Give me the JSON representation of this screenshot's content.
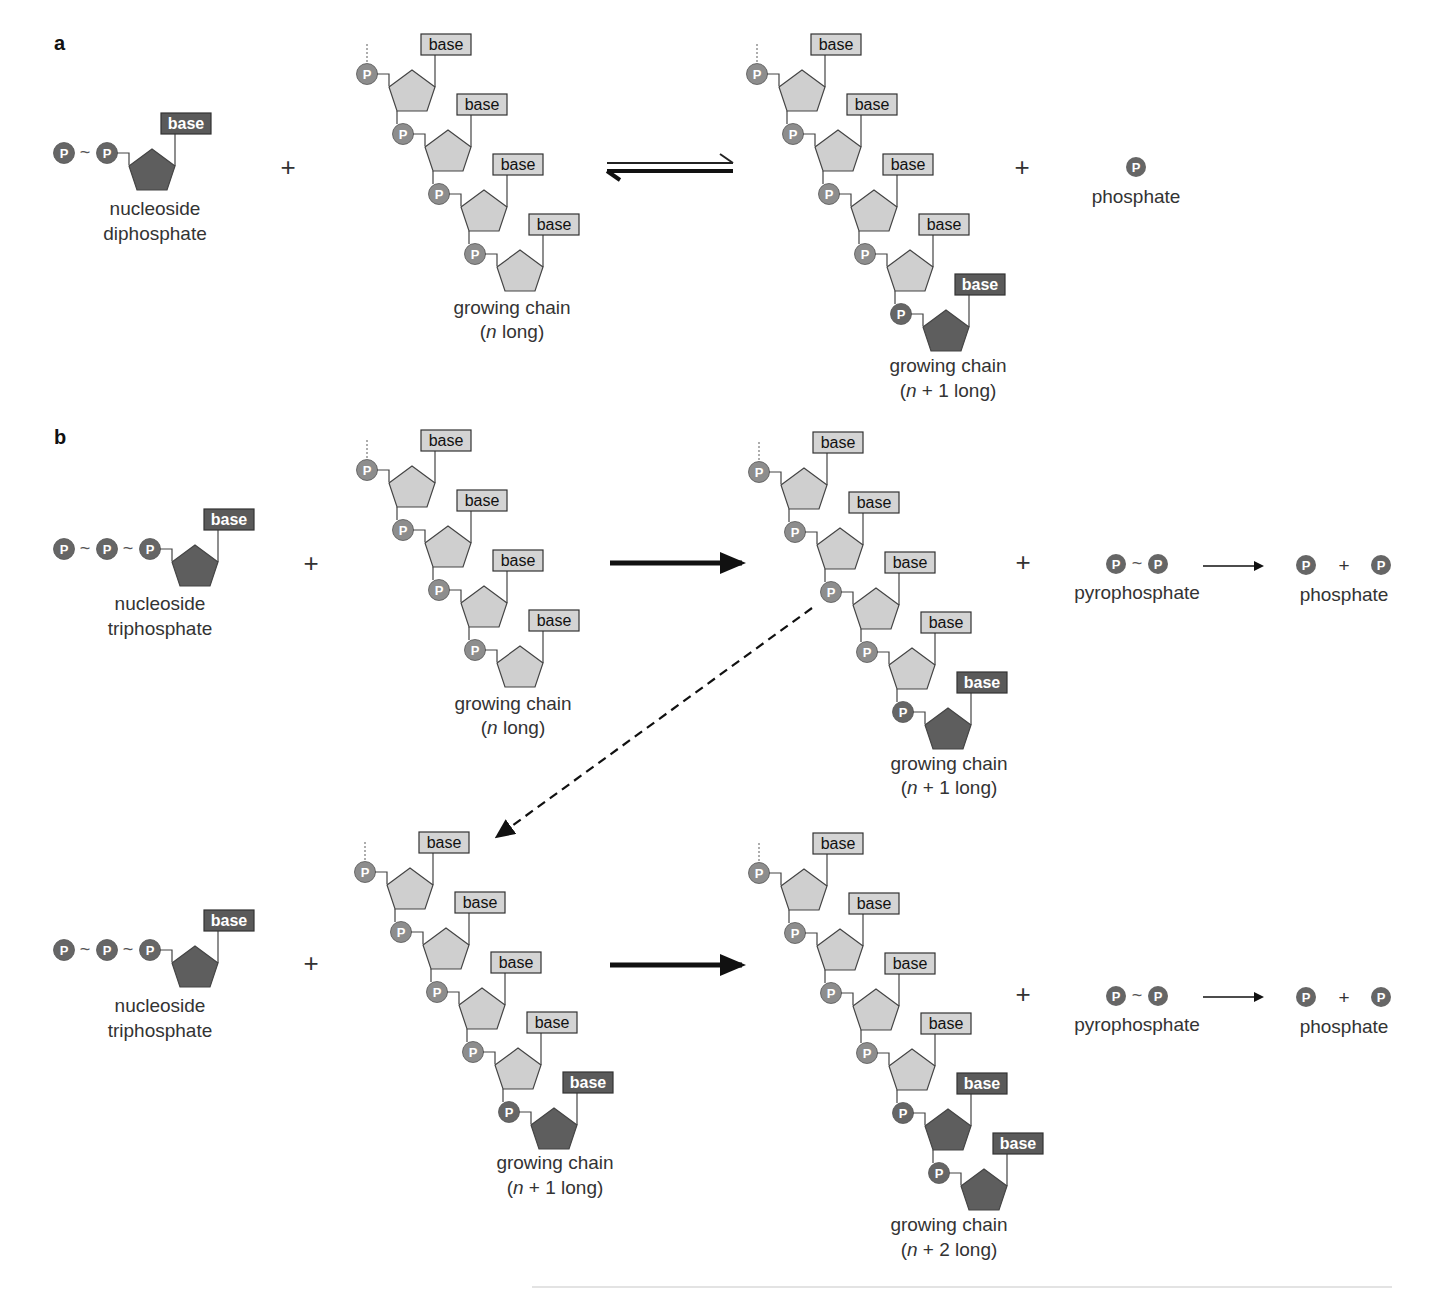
{
  "colors": {
    "phosphate_fill": "#707070",
    "phosphate_light_fill": "#8a8a8a",
    "sugar_light": "#cfcfcf",
    "sugar_dark": "#5e5e5e",
    "base_light": "#d4d4d4",
    "base_dark": "#5a5a5a",
    "stroke": "#444444",
    "text": "#333333"
  },
  "glyphs": {
    "phosphate": "P",
    "tilde": "~",
    "plus": "+",
    "base": "base"
  },
  "panels": {
    "a": {
      "label": "a"
    },
    "b": {
      "label": "b"
    }
  },
  "labels": {
    "a_ndp": [
      "nucleoside",
      "diphosphate"
    ],
    "a_chain_n": [
      "growing chain",
      "(n long)"
    ],
    "a_chain_n1": [
      "growing chain",
      "(n + 1 long)"
    ],
    "a_phosphate": "phosphate",
    "b1_ntp": [
      "nucleoside",
      "triphosphate"
    ],
    "b1_chain_n": [
      "growing chain",
      "(n long)"
    ],
    "b1_chain_n1": [
      "growing chain",
      "(n + 1 long)"
    ],
    "b1_pyro": "pyrophosphate",
    "b1_phosphate": "phosphate",
    "b2_ntp": [
      "nucleoside",
      "triphosphate"
    ],
    "b2_chain_n1": [
      "growing chain",
      "(n + 1 long)"
    ],
    "b2_chain_n2": [
      "growing chain",
      "(n + 2 long)"
    ],
    "b2_pyro": "pyrophosphate",
    "b2_phosphate": "phosphate"
  },
  "arrows": {
    "a_equilibrium": "reversible (equilibrium)",
    "b1_forward": "forward",
    "b2_forward": "forward",
    "b_dashed": "product feeds next step",
    "pyro_hydrolysis": "hydrolysis"
  },
  "chains": [
    {
      "id": "a_chain_n",
      "x": 367,
      "y": 74,
      "light": 4,
      "dark": 0
    },
    {
      "id": "a_chain_n1",
      "x": 757,
      "y": 74,
      "light": 4,
      "dark": 1
    },
    {
      "id": "b1_chain_n",
      "x": 367,
      "y": 470,
      "light": 4,
      "dark": 0
    },
    {
      "id": "b1_chain_n1",
      "x": 759,
      "y": 472,
      "light": 4,
      "dark": 1
    },
    {
      "id": "b2_chain_n1",
      "x": 365,
      "y": 872,
      "light": 4,
      "dark": 1
    },
    {
      "id": "b2_chain_n2",
      "x": 759,
      "y": 873,
      "light": 4,
      "dark": 2
    }
  ],
  "nucleotides": [
    {
      "id": "a_ndp",
      "x": 64,
      "y": 153,
      "phosphates": 2
    },
    {
      "id": "b1_ntp",
      "x": 64,
      "y": 549,
      "phosphates": 3
    },
    {
      "id": "b2_ntp",
      "x": 64,
      "y": 950,
      "phosphates": 3
    }
  ]
}
